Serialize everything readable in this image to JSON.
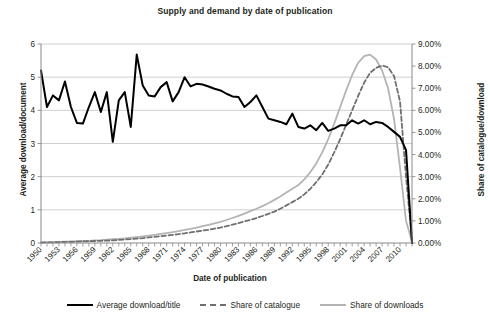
{
  "chart_data": {
    "type": "line",
    "title": "Supply and demand by date of publication",
    "xlabel": "Date of publication",
    "ylabel": "Average download/document",
    "y2label": "Share of catalogue/download",
    "xlim": [
      1950,
      2012
    ],
    "ylim": [
      0,
      6
    ],
    "y2lim": [
      0,
      9
    ],
    "y_ticks": [
      "0",
      "1",
      "2",
      "3",
      "4",
      "5",
      "6"
    ],
    "y2_ticks": [
      "0.00%",
      "1.00%",
      "2.00%",
      "3.00%",
      "4.00%",
      "5.00%",
      "6.00%",
      "7.00%",
      "8.00%",
      "9.00%"
    ],
    "x_ticks": [
      "1950",
      "1953",
      "1956",
      "1959",
      "1962",
      "1965",
      "1968",
      "1971",
      "1974",
      "1977",
      "1980",
      "1983",
      "1986",
      "1989",
      "1992",
      "1995",
      "1998",
      "2001",
      "2004",
      "2007",
      "2010"
    ],
    "grid": true,
    "legend_position": "bottom",
    "x": [
      1950,
      1951,
      1952,
      1953,
      1954,
      1955,
      1956,
      1957,
      1958,
      1959,
      1960,
      1961,
      1962,
      1963,
      1964,
      1965,
      1966,
      1967,
      1968,
      1969,
      1970,
      1971,
      1972,
      1973,
      1974,
      1975,
      1976,
      1977,
      1978,
      1979,
      1980,
      1981,
      1982,
      1983,
      1984,
      1985,
      1986,
      1987,
      1988,
      1989,
      1990,
      1991,
      1992,
      1993,
      1994,
      1995,
      1996,
      1997,
      1998,
      1999,
      2000,
      2001,
      2002,
      2003,
      2004,
      2005,
      2006,
      2007,
      2008,
      2009,
      2010,
      2011,
      2012
    ],
    "series": [
      {
        "name": "Average download/title",
        "axis": "left",
        "color": "#000000",
        "style": "solid",
        "values": [
          5.2,
          4.1,
          4.45,
          4.3,
          4.87,
          4.1,
          3.62,
          3.6,
          4.1,
          4.55,
          3.95,
          4.55,
          3.05,
          4.3,
          4.55,
          3.5,
          5.68,
          4.75,
          4.45,
          4.42,
          4.7,
          4.85,
          4.27,
          4.55,
          5.0,
          4.72,
          4.8,
          4.78,
          4.72,
          4.65,
          4.6,
          4.5,
          4.42,
          4.4,
          4.1,
          4.25,
          4.45,
          4.1,
          3.75,
          3.7,
          3.65,
          3.58,
          3.9,
          3.5,
          3.45,
          3.55,
          3.4,
          3.62,
          3.38,
          3.45,
          3.55,
          3.55,
          3.7,
          3.6,
          3.7,
          3.58,
          3.65,
          3.62,
          3.5,
          3.35,
          3.2,
          2.8,
          0.0
        ]
      },
      {
        "name": "Share of catalogue",
        "axis": "right",
        "color": "#6f6f6f",
        "style": "dashed",
        "values": [
          0.02,
          0.03,
          0.03,
          0.04,
          0.05,
          0.05,
          0.06,
          0.07,
          0.08,
          0.09,
          0.1,
          0.11,
          0.12,
          0.14,
          0.16,
          0.18,
          0.2,
          0.22,
          0.25,
          0.28,
          0.31,
          0.34,
          0.37,
          0.4,
          0.44,
          0.48,
          0.52,
          0.56,
          0.6,
          0.65,
          0.7,
          0.76,
          0.83,
          0.9,
          0.98,
          1.05,
          1.13,
          1.22,
          1.32,
          1.42,
          1.55,
          1.7,
          1.85,
          2.0,
          2.2,
          2.45,
          2.75,
          3.1,
          3.55,
          4.1,
          4.7,
          5.35,
          6.0,
          6.65,
          7.25,
          7.7,
          7.92,
          8.02,
          7.95,
          7.55,
          6.4,
          3.0,
          0.15
        ]
      },
      {
        "name": "Share of downloads",
        "axis": "right",
        "color": "#b4b4b4",
        "style": "solid",
        "values": [
          0.03,
          0.04,
          0.04,
          0.05,
          0.06,
          0.07,
          0.08,
          0.09,
          0.1,
          0.12,
          0.13,
          0.15,
          0.17,
          0.19,
          0.21,
          0.24,
          0.27,
          0.3,
          0.33,
          0.37,
          0.41,
          0.45,
          0.49,
          0.54,
          0.59,
          0.64,
          0.7,
          0.76,
          0.82,
          0.89,
          0.96,
          1.04,
          1.13,
          1.23,
          1.33,
          1.44,
          1.55,
          1.67,
          1.8,
          1.95,
          2.1,
          2.28,
          2.45,
          2.62,
          2.88,
          3.2,
          3.6,
          4.1,
          4.7,
          5.4,
          6.15,
          6.9,
          7.6,
          8.15,
          8.45,
          8.52,
          8.3,
          7.8,
          7.0,
          5.6,
          3.4,
          1.0,
          0.08
        ]
      }
    ]
  },
  "legend": {
    "items": [
      {
        "label": "Average download/title",
        "style": "solid-black"
      },
      {
        "label": "Share of catalogue",
        "style": "dashed-gray"
      },
      {
        "label": "Share of downloads",
        "style": "solid-gray"
      }
    ]
  }
}
